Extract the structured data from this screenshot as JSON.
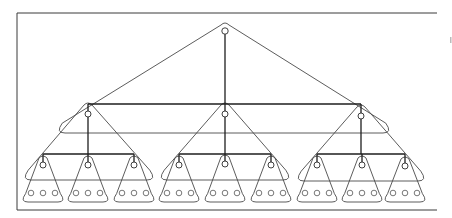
{
  "diagram": {
    "type": "hierarchical-tree",
    "colors": {
      "stroke": "#1e1e1e",
      "hull": "#4a4a4a",
      "background": "#ffffff"
    },
    "frame": {
      "x": 17,
      "y": 13,
      "right": 437,
      "bottom": 210,
      "open_right": true
    },
    "root": {
      "id": "root",
      "x": 225,
      "y": 31,
      "r": 3.2
    },
    "level2_bar": {
      "y": 104,
      "x1": 88,
      "x2": 361
    },
    "level2": [
      {
        "id": "n1",
        "x": 88,
        "y": 114
      },
      {
        "id": "n2",
        "x": 225,
        "y": 114
      },
      {
        "id": "n3",
        "x": 361,
        "y": 116
      }
    ],
    "level3_bar_y": 154,
    "level3": [
      {
        "id": "n1-1",
        "parent": "n1",
        "x": 43,
        "y": 165
      },
      {
        "id": "n1-2",
        "parent": "n1",
        "x": 88,
        "y": 165
      },
      {
        "id": "n1-3",
        "parent": "n1",
        "x": 134,
        "y": 165
      },
      {
        "id": "n2-1",
        "parent": "n2",
        "x": 179,
        "y": 165
      },
      {
        "id": "n2-2",
        "parent": "n2",
        "x": 225,
        "y": 164
      },
      {
        "id": "n2-3",
        "parent": "n2",
        "x": 271,
        "y": 165
      },
      {
        "id": "n3-1",
        "parent": "n3",
        "x": 317,
        "y": 165
      },
      {
        "id": "n3-2",
        "parent": "n3",
        "x": 362,
        "y": 165
      },
      {
        "id": "n3-3",
        "parent": "n3",
        "x": 405,
        "y": 166
      }
    ],
    "leaves_per_node": 3,
    "leaf_row_y": 193,
    "leaf_spacing": 12,
    "node_count": {
      "root": 1,
      "level2": 3,
      "level3": 9,
      "leaves": 27
    }
  }
}
